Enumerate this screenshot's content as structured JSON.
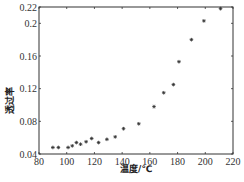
{
  "chart_data": {
    "type": "scatter",
    "title": "",
    "xlabel": "温度/℃",
    "ylabel": "透过率",
    "xlim": [
      80,
      220
    ],
    "ylim": [
      0.04,
      0.22
    ],
    "xticks": [
      80,
      100,
      120,
      140,
      160,
      180,
      200,
      220
    ],
    "yticks": [
      0.04,
      0.08,
      0.12,
      0.16,
      0.2,
      0.22
    ],
    "ytick_labels": [
      "0.04",
      "0.08",
      "0.12",
      "0.16",
      "0.2",
      "0.22"
    ],
    "grid": false,
    "legend": null,
    "marker": "*",
    "series": [
      {
        "name": "透过率",
        "x": [
          90,
          94,
          101,
          104,
          107,
          110,
          114,
          118,
          123,
          129,
          135,
          141,
          152,
          163,
          170,
          177,
          181,
          190,
          199,
          211
        ],
        "y": [
          0.048,
          0.048,
          0.048,
          0.05,
          0.054,
          0.052,
          0.055,
          0.059,
          0.054,
          0.058,
          0.061,
          0.071,
          0.077,
          0.098,
          0.115,
          0.125,
          0.153,
          0.18,
          0.203,
          0.218
        ]
      }
    ]
  },
  "colors": {
    "axis": "#333333",
    "marker": "#333333"
  },
  "caption": "……"
}
